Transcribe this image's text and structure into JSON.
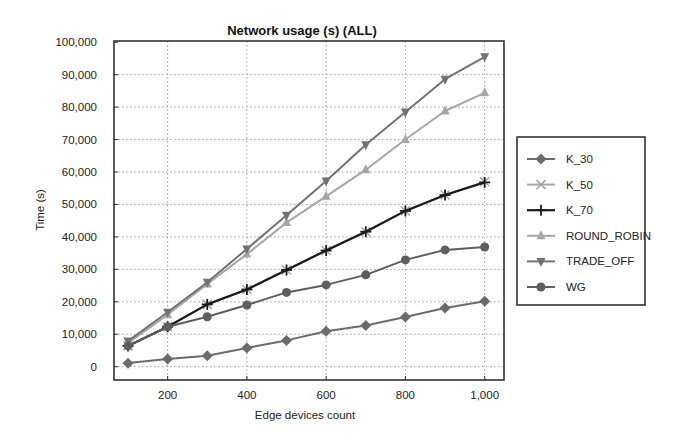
{
  "chart_data": {
    "type": "line",
    "title": "Network usage (s) (ALL)",
    "xlabel": "Edge devices count",
    "ylabel": "Time (s)",
    "x": [
      100,
      200,
      300,
      400,
      500,
      600,
      700,
      800,
      900,
      1000
    ],
    "xticks": [
      200,
      400,
      600,
      800,
      1000
    ],
    "xtick_labels": [
      "200",
      "400",
      "600",
      "800",
      "1,000"
    ],
    "xlim": [
      50,
      1030
    ],
    "ylim": [
      0,
      100000
    ],
    "yticks": [
      0,
      10000,
      20000,
      30000,
      40000,
      50000,
      60000,
      70000,
      80000,
      90000,
      100000
    ],
    "ytick_labels": [
      "0",
      "10,000",
      "20,000",
      "30,000",
      "40,000",
      "50,000",
      "60,000",
      "70,000",
      "80,000",
      "90,000",
      "100,000"
    ],
    "grid": true,
    "legend_position": "right",
    "series": [
      {
        "name": "K_30",
        "marker": "diamond",
        "color": "#6b6b6b",
        "values": [
          1100,
          2400,
          3400,
          5800,
          8100,
          10900,
          12700,
          15300,
          18100,
          20200
        ]
      },
      {
        "name": "K_50",
        "marker": "x",
        "color": "#a8a8a8",
        "values": [
          6400,
          12300,
          19200,
          23800,
          29800,
          35800,
          41600,
          48000,
          52900,
          57000
        ]
      },
      {
        "name": "K_70",
        "marker": "plus",
        "color": "#1a1a1a",
        "values": [
          6400,
          12300,
          19200,
          23800,
          29800,
          35800,
          41600,
          48000,
          52900,
          56800
        ]
      },
      {
        "name": "ROUND_ROBIN",
        "marker": "triangle-up",
        "color": "#a6a6a6",
        "values": [
          7200,
          16000,
          25500,
          34700,
          44400,
          52500,
          60700,
          70000,
          78800,
          84400
        ]
      },
      {
        "name": "TRADE_OFF",
        "marker": "triangle-down",
        "color": "#727272",
        "values": [
          7900,
          16800,
          26000,
          36300,
          46700,
          57200,
          68400,
          78500,
          88600,
          95500
        ]
      },
      {
        "name": "WG",
        "marker": "circle",
        "color": "#5e5e5e",
        "values": [
          6400,
          12300,
          15400,
          19000,
          22900,
          25200,
          28300,
          32900,
          36000,
          36900
        ]
      }
    ]
  }
}
